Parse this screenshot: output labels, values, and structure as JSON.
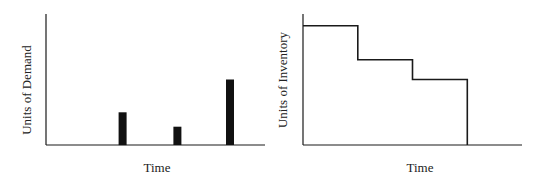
{
  "chart_data": [
    {
      "type": "bar",
      "title": "",
      "xlabel": "Time",
      "ylabel": "Units of Demand",
      "x": [
        0.35,
        0.6,
        0.84
      ],
      "values": [
        0.25,
        0.14,
        0.5
      ],
      "xlim": [
        0,
        1
      ],
      "ylim": [
        0,
        1
      ],
      "ticks": "none",
      "grid": false,
      "legend": "none"
    },
    {
      "type": "line",
      "style": "step",
      "title": "",
      "xlabel": "Time",
      "ylabel": "Units of Inventory",
      "points": [
        {
          "x": 0.0,
          "y": 0.91
        },
        {
          "x": 0.25,
          "y": 0.91
        },
        {
          "x": 0.25,
          "y": 0.65
        },
        {
          "x": 0.5,
          "y": 0.65
        },
        {
          "x": 0.5,
          "y": 0.5
        },
        {
          "x": 0.75,
          "y": 0.5
        },
        {
          "x": 0.75,
          "y": 0.0
        }
      ],
      "xlim": [
        0,
        1
      ],
      "ylim": [
        0,
        1
      ],
      "ticks": "none",
      "grid": false,
      "legend": "none"
    }
  ]
}
